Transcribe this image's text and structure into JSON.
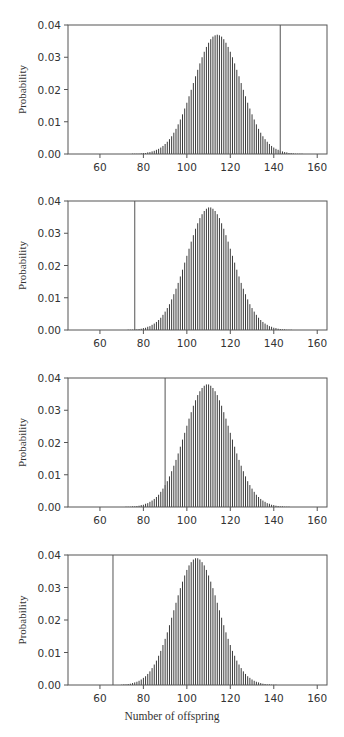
{
  "chart_data": [
    {
      "type": "bar",
      "panel": 1,
      "title": "",
      "xlabel": "",
      "ylabel": "Probability",
      "x_start": 70,
      "x_end": 160,
      "xlim": [
        45.3,
        164.5
      ],
      "ylim": [
        0,
        0.04
      ],
      "xticks": [
        60,
        80,
        100,
        120,
        140,
        160
      ],
      "yticks": [
        "0.00",
        "0.01",
        "0.02",
        "0.03",
        "0.04"
      ],
      "grid": false,
      "vertical_line_x": 143,
      "values": [
        0,
        0,
        0,
        0,
        0,
        0.0001,
        0.0001,
        0.0001,
        0.0001,
        0.0002,
        0.0003,
        0.0003,
        0.0005,
        0.0006,
        0.0008,
        0.001,
        0.0013,
        0.0016,
        0.002,
        0.0025,
        0.0031,
        0.0038,
        0.0046,
        0.0055,
        0.0066,
        0.0078,
        0.0092,
        0.0107,
        0.0123,
        0.0141,
        0.0159,
        0.0179,
        0.0199,
        0.022,
        0.0241,
        0.0261,
        0.0281,
        0.03,
        0.0317,
        0.0332,
        0.0345,
        0.0356,
        0.0364,
        0.0368,
        0.037,
        0.0368,
        0.0364,
        0.0356,
        0.0345,
        0.0332,
        0.0317,
        0.03,
        0.0281,
        0.0261,
        0.0241,
        0.022,
        0.0199,
        0.0179,
        0.0159,
        0.0141,
        0.0123,
        0.0107,
        0.0092,
        0.0078,
        0.0066,
        0.0055,
        0.0046,
        0.0038,
        0.0031,
        0.0025,
        0.002,
        0.0016,
        0.0013,
        0.001,
        0.0008,
        0.0006,
        0.0005,
        0.0003,
        0.0003,
        0.0002,
        0.0001,
        0.0001,
        0.0001,
        0.0001,
        0,
        0,
        0,
        0,
        0,
        0,
        0
      ]
    },
    {
      "type": "bar",
      "panel": 2,
      "title": "",
      "xlabel": "",
      "ylabel": "Probability",
      "x_start": 70,
      "x_end": 160,
      "xlim": [
        45.3,
        164.5
      ],
      "ylim": [
        0,
        0.04
      ],
      "xticks": [
        60,
        80,
        100,
        120,
        140,
        160
      ],
      "yticks": [
        "0.00",
        "0.01",
        "0.02",
        "0.03",
        "0.04"
      ],
      "grid": false,
      "vertical_line_x": 76,
      "values": [
        0,
        0,
        0,
        0.0001,
        0.0001,
        0.0001,
        0.0002,
        0.0002,
        0.0003,
        0.0004,
        0.0006,
        0.0007,
        0.001,
        0.0012,
        0.0016,
        0.002,
        0.0025,
        0.0031,
        0.0038,
        0.0047,
        0.0057,
        0.0068,
        0.008,
        0.0095,
        0.0111,
        0.0128,
        0.0146,
        0.0166,
        0.0187,
        0.0209,
        0.023,
        0.0252,
        0.0274,
        0.0294,
        0.0314,
        0.0331,
        0.0347,
        0.0359,
        0.0369,
        0.0376,
        0.038,
        0.038,
        0.0376,
        0.0369,
        0.0359,
        0.0347,
        0.0331,
        0.0314,
        0.0294,
        0.0274,
        0.0252,
        0.023,
        0.0209,
        0.0187,
        0.0166,
        0.0146,
        0.0128,
        0.0111,
        0.0095,
        0.008,
        0.0068,
        0.0057,
        0.0047,
        0.0038,
        0.0031,
        0.0025,
        0.002,
        0.0016,
        0.0012,
        0.001,
        0.0007,
        0.0006,
        0.0004,
        0.0003,
        0.0002,
        0.0002,
        0.0001,
        0.0001,
        0.0001,
        0,
        0,
        0,
        0,
        0,
        0,
        0,
        0,
        0,
        0,
        0,
        0
      ]
    },
    {
      "type": "bar",
      "panel": 3,
      "title": "",
      "xlabel": "",
      "ylabel": "Probability",
      "x_start": 70,
      "x_end": 160,
      "xlim": [
        45.3,
        164.5
      ],
      "ylim": [
        0,
        0.04
      ],
      "xticks": [
        60,
        80,
        100,
        120,
        140,
        160
      ],
      "yticks": [
        "0.00",
        "0.01",
        "0.02",
        "0.03",
        "0.04"
      ],
      "grid": false,
      "vertical_line_x": 90,
      "values": [
        0,
        0,
        0.0001,
        0.0001,
        0.0001,
        0.0002,
        0.0002,
        0.0003,
        0.0004,
        0.0006,
        0.0007,
        0.001,
        0.0012,
        0.0016,
        0.002,
        0.0025,
        0.0031,
        0.0038,
        0.0047,
        0.0057,
        0.0068,
        0.008,
        0.0095,
        0.0111,
        0.0128,
        0.0146,
        0.0166,
        0.0187,
        0.0209,
        0.023,
        0.0252,
        0.0274,
        0.0294,
        0.0314,
        0.0331,
        0.0347,
        0.0359,
        0.0369,
        0.0376,
        0.038,
        0.038,
        0.0376,
        0.0369,
        0.0359,
        0.0347,
        0.0331,
        0.0314,
        0.0294,
        0.0274,
        0.0252,
        0.023,
        0.0209,
        0.0187,
        0.0166,
        0.0146,
        0.0128,
        0.0111,
        0.0095,
        0.008,
        0.0068,
        0.0057,
        0.0047,
        0.0038,
        0.0031,
        0.0025,
        0.002,
        0.0016,
        0.0012,
        0.001,
        0.0007,
        0.0006,
        0.0004,
        0.0003,
        0.0002,
        0.0002,
        0.0001,
        0.0001,
        0.0001,
        0,
        0,
        0,
        0,
        0,
        0,
        0,
        0,
        0,
        0,
        0,
        0,
        0
      ]
    },
    {
      "type": "bar",
      "panel": 4,
      "title": "",
      "xlabel": "Number of offspring",
      "ylabel": "Probability",
      "x_start": 70,
      "x_end": 160,
      "xlim": [
        45.3,
        164.5
      ],
      "ylim": [
        0,
        0.04
      ],
      "xticks": [
        60,
        80,
        100,
        120,
        140,
        160
      ],
      "yticks": [
        "0.00",
        "0.01",
        "0.02",
        "0.03",
        "0.04"
      ],
      "grid": false,
      "vertical_line_x": 66,
      "values": [
        0.0001,
        0.0002,
        0.0002,
        0.0003,
        0.0004,
        0.0006,
        0.0008,
        0.001,
        0.0013,
        0.0017,
        0.0022,
        0.0027,
        0.0034,
        0.0042,
        0.0052,
        0.0063,
        0.0075,
        0.009,
        0.0105,
        0.0123,
        0.0142,
        0.0162,
        0.0184,
        0.0207,
        0.023,
        0.0253,
        0.0276,
        0.0298,
        0.0318,
        0.0337,
        0.0354,
        0.0368,
        0.0378,
        0.0386,
        0.039,
        0.039,
        0.0386,
        0.0378,
        0.0368,
        0.0354,
        0.0337,
        0.0318,
        0.0298,
        0.0276,
        0.0253,
        0.023,
        0.0207,
        0.0184,
        0.0162,
        0.0142,
        0.0123,
        0.0105,
        0.009,
        0.0075,
        0.0063,
        0.0052,
        0.0042,
        0.0034,
        0.0027,
        0.0022,
        0.0017,
        0.0013,
        0.001,
        0.0008,
        0.0006,
        0.0004,
        0.0003,
        0.0002,
        0.0002,
        0.0001,
        0.0001,
        0.0001,
        0,
        0,
        0,
        0,
        0,
        0,
        0,
        0,
        0,
        0,
        0,
        0,
        0,
        0,
        0,
        0,
        0,
        0,
        0
      ]
    }
  ],
  "figure": {
    "xlabel": "Number of offspring",
    "ylabel": "Probability",
    "colors": {
      "axis": "#555555",
      "bar": "#3a3a3a",
      "marker_line": "#707070",
      "text": "#333333"
    }
  }
}
